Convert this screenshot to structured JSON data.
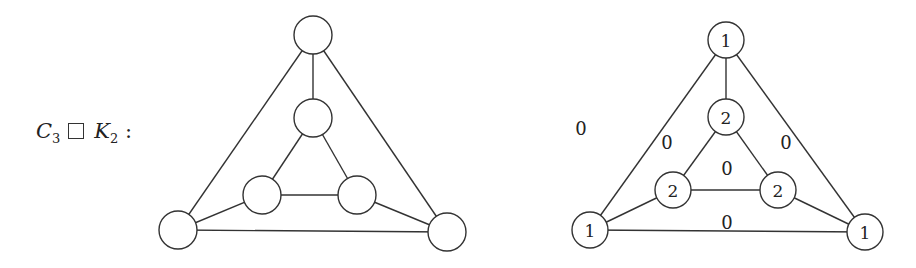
{
  "title": {
    "c": "C",
    "c_sub": "3",
    "k": "K",
    "k_sub": "2",
    "colon": ":"
  },
  "left_graph": {
    "node_radius": 19,
    "nodes": [
      {
        "id": "top",
        "x": 313,
        "y": 35,
        "label": ""
      },
      {
        "id": "inner-top",
        "x": 313,
        "y": 118,
        "label": ""
      },
      {
        "id": "inner-left",
        "x": 262,
        "y": 195,
        "label": ""
      },
      {
        "id": "inner-right",
        "x": 357,
        "y": 195,
        "label": ""
      },
      {
        "id": "outer-left",
        "x": 178,
        "y": 230,
        "label": ""
      },
      {
        "id": "outer-right",
        "x": 447,
        "y": 232,
        "label": ""
      }
    ]
  },
  "right_graph": {
    "node_radius": 18,
    "nodes": [
      {
        "id": "top",
        "x": 726,
        "y": 40,
        "label": "1"
      },
      {
        "id": "inner-top",
        "x": 726,
        "y": 117,
        "label": "2"
      },
      {
        "id": "inner-left",
        "x": 673,
        "y": 190,
        "label": "2"
      },
      {
        "id": "inner-right",
        "x": 778,
        "y": 190,
        "label": "2"
      },
      {
        "id": "outer-left",
        "x": 590,
        "y": 230,
        "label": "1"
      },
      {
        "id": "outer-right",
        "x": 865,
        "y": 232,
        "label": "1"
      }
    ],
    "face_labels": [
      {
        "id": "outer-face",
        "x": 581,
        "y": 128,
        "label": "0"
      },
      {
        "id": "left-face",
        "x": 667,
        "y": 142,
        "label": "0"
      },
      {
        "id": "right-face",
        "x": 786,
        "y": 142,
        "label": "0"
      },
      {
        "id": "inner-face",
        "x": 727,
        "y": 168,
        "label": "0"
      },
      {
        "id": "bottom-face",
        "x": 727,
        "y": 222,
        "label": "0"
      }
    ]
  },
  "edges": [
    [
      "top",
      "inner-top"
    ],
    [
      "top",
      "outer-left"
    ],
    [
      "top",
      "outer-right"
    ],
    [
      "inner-top",
      "inner-left"
    ],
    [
      "inner-top",
      "inner-right"
    ],
    [
      "inner-left",
      "inner-right"
    ],
    [
      "inner-left",
      "outer-left"
    ],
    [
      "inner-right",
      "outer-right"
    ],
    [
      "outer-left",
      "outer-right"
    ]
  ]
}
